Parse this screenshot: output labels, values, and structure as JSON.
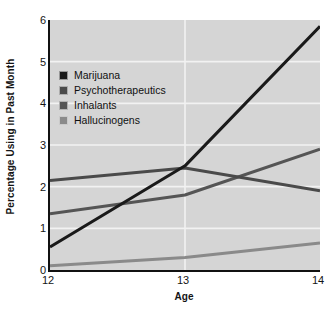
{
  "chart_data": {
    "type": "line",
    "title": "",
    "xlabel": "Age",
    "ylabel": "Percentage Using in Past Month",
    "x": [
      12,
      13,
      14
    ],
    "xtick_labels": [
      "12",
      "13",
      "14"
    ],
    "ytick_labels": [
      "0",
      "1",
      "2",
      "3",
      "4",
      "5",
      "6"
    ],
    "xlim": [
      12,
      14
    ],
    "ylim": [
      0,
      6
    ],
    "grid": "horizontal-white-gridlines",
    "legend_position": "upper-left-inside",
    "plot_background": "#d5d5d5",
    "series": [
      {
        "name": "Marijuana",
        "color": "#1a1a1a",
        "values": [
          0.55,
          2.5,
          5.85
        ]
      },
      {
        "name": "Psychotherapeutics",
        "color": "#4a4a4a",
        "values": [
          2.15,
          2.45,
          1.9
        ]
      },
      {
        "name": "Inhalants",
        "color": "#555555",
        "values": [
          1.35,
          1.8,
          2.9
        ]
      },
      {
        "name": "Hallucinogens",
        "color": "#8a8a8a",
        "values": [
          0.1,
          0.3,
          0.65
        ]
      }
    ]
  },
  "axes": {
    "y_title": "Percentage Using in Past Month",
    "x_title": "Age"
  },
  "legend": {
    "items": [
      {
        "label": "Marijuana",
        "color": "#1a1a1a"
      },
      {
        "label": "Psychotherapeutics",
        "color": "#4a4a4a"
      },
      {
        "label": "Inhalants",
        "color": "#555555"
      },
      {
        "label": "Hallucinogens",
        "color": "#8a8a8a"
      }
    ]
  }
}
